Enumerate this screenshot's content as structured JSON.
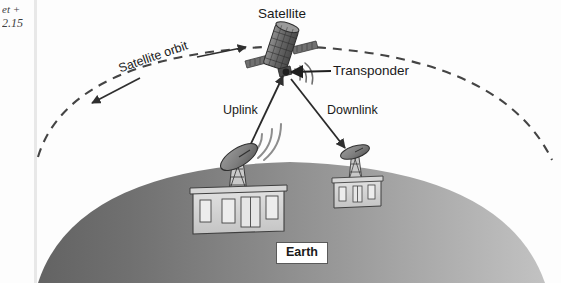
{
  "page": {
    "width": 561,
    "height": 283,
    "background_color": "#fdfdfd"
  },
  "corner_mark": {
    "line1": "et +",
    "line2": "2.15"
  },
  "labels": {
    "satellite": "Satellite",
    "transponder": "Transponder",
    "uplink": "Uplink",
    "downlink": "Downlink",
    "satellite_orbit": "Satellite orbit",
    "earth": "Earth"
  },
  "icons": {
    "satellite": "satellite-icon",
    "uplink_dish": "ground-station-dish-icon",
    "downlink_dish": "receiver-dish-icon",
    "ground_station_building": "building-icon",
    "receiver_building": "building-icon",
    "radio_waves_uplink": "radio-waves-icon",
    "radio_waves_satellite": "radio-waves-icon",
    "orbit_arrow_right": "arrow-right-icon",
    "orbit_arrow_left": "arrow-left-icon",
    "transponder_arrow": "arrow-left-icon",
    "downlink_arrow": "arrow-down-icon",
    "uplink_arrow": "arrow-up-icon"
  },
  "colors": {
    "earth_dark": "#6d6d6d",
    "earth_light": "#b9b9b9",
    "line": "#3c3c3c",
    "orbit_dash": "#444444",
    "label_text": "#1a1a1a",
    "earth_box_border": "#5a5a5a",
    "rule": "#e8e8e8"
  },
  "elements": {
    "orbit_style": "dashed",
    "orbit_direction": "bidirectional",
    "earth_shape": "dome",
    "ground_stations": 2
  }
}
